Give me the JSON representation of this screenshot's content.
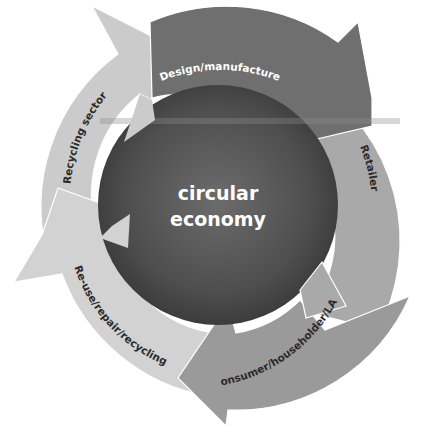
{
  "diagram": {
    "center": {
      "line1": "circular",
      "line2": "economy"
    },
    "segments": [
      {
        "label": "Design/manufacture",
        "color": "#6f6f6f",
        "text_color": "#ffffff"
      },
      {
        "label": "Retailer",
        "color": "#a9a9a9",
        "text_color": "#2b2b2b"
      },
      {
        "label": "Consumer/householder/LAs",
        "color": "#9a9a9a",
        "text_color": "#2b2b2b"
      },
      {
        "label": "Re-use/repair/recycling",
        "color": "#d2d2d2",
        "text_color": "#2b2b2b"
      },
      {
        "label": "Recycling sector",
        "color": "#cbcbcb",
        "text_color": "#2b2b2b"
      }
    ],
    "core_colors": {
      "inner": "#6a6a6a",
      "outer": "#3a3a3a"
    }
  }
}
